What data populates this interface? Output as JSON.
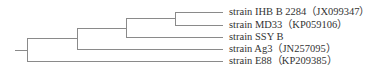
{
  "tree": {
    "line_color": "#8a8a8a",
    "text_color": "#333333",
    "leaves": [
      {
        "label": "strain IHB B 2284【JX099347】",
        "display": "strain IHB B 2284（JX099347）",
        "y": 12
      },
      {
        "label": "strain MD33（KP059106）",
        "display": "strain MD33（KP059106）",
        "y": 25
      },
      {
        "label": "strain SSY B",
        "display": "strain SSY B",
        "y": 37
      },
      {
        "label": "strain Ag3（JN257095）",
        "display": "strain Ag3（JN257095）",
        "y": 49
      },
      {
        "label": "strain E88（KP209385）",
        "display": "strain E88（KP209385）",
        "y": 61
      }
    ]
  }
}
